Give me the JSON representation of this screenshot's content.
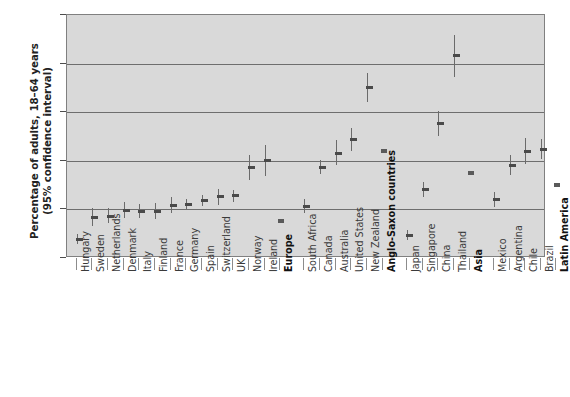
{
  "chart_data": {
    "type": "scatter",
    "title": "",
    "xlabel": "",
    "ylabel": "Percentage of adults, 18–64 years (95% confidence interval)",
    "ylabel_line1": "Percentage of adults, 18–64 years",
    "ylabel_line2": "(95% confidence interval)",
    "ylim": [
      0,
      25
    ],
    "ytick_labels": [
      "0%",
      "5%",
      "10%",
      "15%",
      "20%",
      "25%"
    ],
    "ytick_values": [
      0,
      5,
      10,
      15,
      20,
      25
    ],
    "grid": true,
    "grid_axis": "y",
    "legend": "none",
    "error_bar_type": "95% confidence interval",
    "categories": [
      "Hungary",
      "Sweden",
      "Netherlands",
      "Denmark",
      "Italy",
      "Finland",
      "France",
      "Germany",
      "Spain",
      "Switzerland",
      "UK",
      "Norway",
      "Ireland",
      "Europe",
      "South Africa",
      "Canada",
      "Australia",
      "United States",
      "New Zealand",
      "Anglo-Saxon countries",
      "Japan",
      "Singapore",
      "China",
      "Thailand",
      "Asia",
      "Mexico",
      "Argentina",
      "Chile",
      "Brazil",
      "Latin America"
    ],
    "points": [
      {
        "label": "Hungary",
        "value": 1.9,
        "low": 1.4,
        "high": 2.5,
        "group": "Europe",
        "aggregate": false
      },
      {
        "label": "Sweden",
        "value": 4.2,
        "low": 3.3,
        "high": 5.1,
        "group": "Europe",
        "aggregate": false
      },
      {
        "label": "Netherlands",
        "value": 4.3,
        "low": 3.6,
        "high": 5.1,
        "group": "Europe",
        "aggregate": false
      },
      {
        "label": "Denmark",
        "value": 4.9,
        "low": 4.1,
        "high": 5.8,
        "group": "Europe",
        "aggregate": false
      },
      {
        "label": "Italy",
        "value": 4.8,
        "low": 4.1,
        "high": 5.6,
        "group": "Europe",
        "aggregate": false
      },
      {
        "label": "Finland",
        "value": 4.8,
        "low": 4.0,
        "high": 5.7,
        "group": "Europe",
        "aggregate": false
      },
      {
        "label": "France",
        "value": 5.4,
        "low": 4.6,
        "high": 6.3,
        "group": "Europe",
        "aggregate": false
      },
      {
        "label": "Germany",
        "value": 5.5,
        "low": 5.0,
        "high": 6.1,
        "group": "Europe",
        "aggregate": false
      },
      {
        "label": "Spain",
        "value": 5.9,
        "low": 5.4,
        "high": 6.5,
        "group": "Europe",
        "aggregate": false
      },
      {
        "label": "Switzerland",
        "value": 6.3,
        "low": 5.5,
        "high": 7.1,
        "group": "Europe",
        "aggregate": false
      },
      {
        "label": "UK",
        "value": 6.4,
        "low": 5.8,
        "high": 7.0,
        "group": "Europe",
        "aggregate": false
      },
      {
        "label": "Norway",
        "value": 9.3,
        "low": 8.0,
        "high": 10.6,
        "group": "Europe",
        "aggregate": false
      },
      {
        "label": "Ireland",
        "value": 10.0,
        "low": 8.4,
        "high": 11.6,
        "group": "Europe",
        "aggregate": false
      },
      {
        "label": "Europe",
        "value": 3.8,
        "low": 3.8,
        "high": 3.8,
        "group": "Europe",
        "aggregate": true
      },
      {
        "label": "South Africa",
        "value": 5.3,
        "low": 4.6,
        "high": 6.1,
        "group": "Anglo-Saxon countries",
        "aggregate": false
      },
      {
        "label": "Canada",
        "value": 9.3,
        "low": 8.6,
        "high": 10.1,
        "group": "Anglo-Saxon countries",
        "aggregate": false
      },
      {
        "label": "Australia",
        "value": 10.8,
        "low": 9.6,
        "high": 12.1,
        "group": "Anglo-Saxon countries",
        "aggregate": false
      },
      {
        "label": "United States",
        "value": 12.2,
        "low": 11.0,
        "high": 13.4,
        "group": "Anglo-Saxon countries",
        "aggregate": false
      },
      {
        "label": "New Zealand",
        "value": 17.5,
        "low": 16.0,
        "high": 19.0,
        "group": "Anglo-Saxon countries",
        "aggregate": false
      },
      {
        "label": "Anglo-Saxon countries",
        "value": 11.0,
        "low": 11.0,
        "high": 11.0,
        "group": "Anglo-Saxon countries",
        "aggregate": true
      },
      {
        "label": "Japan",
        "value": 2.3,
        "low": 1.8,
        "high": 2.9,
        "group": "Asia",
        "aggregate": false
      },
      {
        "label": "Singapore",
        "value": 7.0,
        "low": 6.3,
        "high": 7.8,
        "group": "Asia",
        "aggregate": false
      },
      {
        "label": "China",
        "value": 13.8,
        "low": 12.5,
        "high": 15.1,
        "group": "Asia",
        "aggregate": false
      },
      {
        "label": "Thailand",
        "value": 20.8,
        "low": 18.6,
        "high": 22.9,
        "group": "Asia",
        "aggregate": false
      },
      {
        "label": "Asia",
        "value": 8.7,
        "low": 8.7,
        "high": 8.7,
        "group": "Asia",
        "aggregate": true
      },
      {
        "label": "Mexico",
        "value": 6.0,
        "low": 5.2,
        "high": 6.8,
        "group": "Latin America",
        "aggregate": false
      },
      {
        "label": "Argentina",
        "value": 9.5,
        "low": 8.5,
        "high": 10.6,
        "group": "Latin America",
        "aggregate": false
      },
      {
        "label": "Chile",
        "value": 11.0,
        "low": 9.7,
        "high": 12.3,
        "group": "Latin America",
        "aggregate": false
      },
      {
        "label": "Brazil",
        "value": 11.2,
        "low": 10.2,
        "high": 12.2,
        "group": "Latin America",
        "aggregate": false
      },
      {
        "label": "Latin America",
        "value": 7.5,
        "low": 7.5,
        "high": 7.5,
        "group": "Latin America",
        "aggregate": true
      }
    ],
    "colors": {
      "plot_background": "#d9d9d9",
      "page_background": "#ffffff",
      "gridline": "#6e6e6e",
      "marker": "#4a4a4a",
      "error_bar": "#6b6b6b",
      "axis": "#808080",
      "text": "#1a1a1a"
    }
  }
}
